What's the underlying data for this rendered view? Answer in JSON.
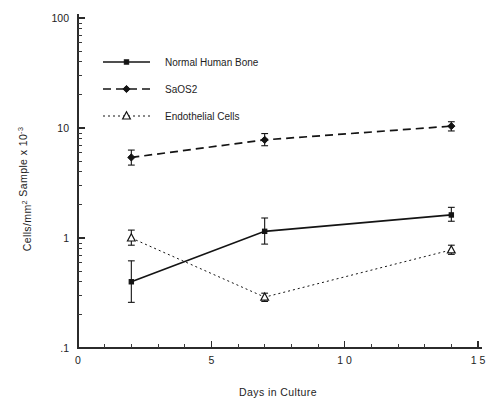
{
  "chart_data": {
    "type": "line",
    "title": "",
    "subtitle": "",
    "xlabel": "Days in Culture",
    "ylabel": "Cells/mm 2   Sample x 10 -3",
    "ylabel_parts": {
      "main1": "Cells/mm",
      "sup1": "2",
      "main2": "Sample x 10",
      "sup2": "-3"
    },
    "x": [
      2,
      7,
      14
    ],
    "xlim": [
      0,
      15
    ],
    "ylim": [
      0.1,
      100
    ],
    "yscale": "log",
    "xscale": "linear",
    "grid": false,
    "frame": "left-bottom",
    "legend_position": "upper-left-inside",
    "xticks": [
      0,
      5,
      10,
      15
    ],
    "xtick_labels": [
      "0",
      "5",
      "1 0",
      "1 5"
    ],
    "xminor_step": 1,
    "yticks": [
      0.1,
      1,
      10,
      100
    ],
    "ytick_labels": [
      ".1",
      "1",
      "10",
      "100"
    ],
    "series": [
      {
        "name": "Normal Human Bone",
        "values": [
          0.4,
          1.15,
          1.62
        ],
        "err_low": [
          0.26,
          0.88,
          1.42
        ],
        "err_high": [
          0.62,
          1.52,
          1.9
        ],
        "linestyle": "solid",
        "marker": "square",
        "marker_fill": "filled",
        "color": "#141414"
      },
      {
        "name": "SaOS2",
        "values": [
          5.4,
          7.8,
          10.4
        ],
        "err_low": [
          4.6,
          6.9,
          9.4
        ],
        "err_high": [
          6.3,
          8.9,
          11.4
        ],
        "linestyle": "dashed",
        "marker": "diamond",
        "marker_fill": "filled",
        "color": "#141414"
      },
      {
        "name": "Endothelial Cells",
        "values": [
          1.0,
          0.29,
          0.78
        ],
        "err_low": [
          0.86,
          0.265,
          0.71
        ],
        "err_high": [
          1.18,
          0.315,
          0.86
        ],
        "linestyle": "dotted",
        "marker": "triangle",
        "marker_fill": "open",
        "color": "#141414"
      }
    ],
    "annotations": []
  },
  "legend": {
    "items": [
      {
        "label": "Normal Human Bone"
      },
      {
        "label": "SaOS2"
      },
      {
        "label": "Endothelial Cells"
      }
    ]
  }
}
